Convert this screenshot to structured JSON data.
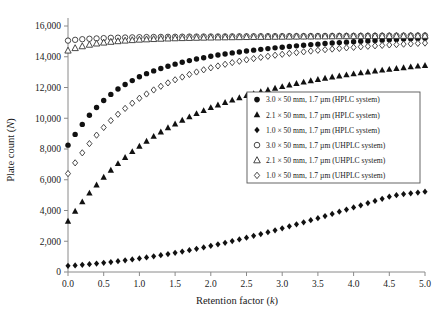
{
  "chart_data": {
    "type": "scatter",
    "title": "",
    "xlabel": "Retention factor (k)",
    "ylabel": "Plate count (N)",
    "xlim": [
      0.0,
      5.0
    ],
    "ylim": [
      0,
      16000
    ],
    "xticks": [
      "0.0",
      "0.5",
      "1.0",
      "1.5",
      "2.0",
      "2.5",
      "3.0",
      "3.5",
      "4.0",
      "4.5",
      "5.0"
    ],
    "xtick_values": [
      0.0,
      0.5,
      1.0,
      1.5,
      2.0,
      2.5,
      3.0,
      3.5,
      4.0,
      4.5,
      5.0
    ],
    "yticks": [
      "0",
      "2,000",
      "4,000",
      "6,000",
      "8,000",
      "10,000",
      "12,000",
      "14,000",
      "16,000"
    ],
    "ytick_values": [
      0,
      2000,
      4000,
      6000,
      8000,
      10000,
      12000,
      14000,
      16000
    ],
    "grid": false,
    "legend_position": "center-right",
    "x": [
      0.0,
      0.1,
      0.2,
      0.3,
      0.4,
      0.5,
      0.6,
      0.7,
      0.8,
      0.9,
      1.0,
      1.1,
      1.2,
      1.3,
      1.4,
      1.5,
      1.6,
      1.7,
      1.8,
      1.9,
      2.0,
      2.1,
      2.2,
      2.3,
      2.4,
      2.5,
      2.6,
      2.7,
      2.8,
      2.9,
      3.0,
      3.1,
      3.2,
      3.3,
      3.4,
      3.5,
      3.6,
      3.7,
      3.8,
      3.9,
      4.0,
      4.1,
      4.2,
      4.3,
      4.4,
      4.5,
      4.6,
      4.7,
      4.8,
      4.9,
      5.0
    ],
    "series": [
      {
        "name": "3.0 × 50 mm, 1.7 µm (HPLC system)",
        "marker": "circle-filled",
        "values": [
          8250,
          8950,
          9600,
          10200,
          10700,
          11150,
          11550,
          11900,
          12200,
          12450,
          12700,
          12900,
          13080,
          13240,
          13380,
          13520,
          13640,
          13750,
          13850,
          13940,
          14030,
          14110,
          14180,
          14250,
          14310,
          14370,
          14430,
          14480,
          14530,
          14580,
          14620,
          14670,
          14710,
          14750,
          14790,
          14820,
          14860,
          14890,
          14920,
          14950,
          14980,
          15010,
          15030,
          15060,
          15080,
          15100,
          15130,
          15150,
          15170,
          15190,
          15210
        ]
      },
      {
        "name": "2.1 × 50 mm, 1.7 µm (HPLC system)",
        "marker": "triangle-filled",
        "values": [
          3300,
          3950,
          4560,
          5130,
          5660,
          6160,
          6620,
          7050,
          7450,
          7830,
          8180,
          8510,
          8820,
          9110,
          9380,
          9630,
          9870,
          10090,
          10300,
          10500,
          10690,
          10860,
          11030,
          11180,
          11330,
          11470,
          11600,
          11720,
          11840,
          11950,
          12060,
          12160,
          12260,
          12350,
          12440,
          12520,
          12600,
          12680,
          12750,
          12820,
          12890,
          12950,
          13010,
          13070,
          13130,
          13180,
          13240,
          13290,
          13340,
          13390,
          13430
        ]
      },
      {
        "name": "1.0 × 50 mm, 1.7 µm (HPLC system)",
        "marker": "diamond-filled",
        "values": [
          400,
          430,
          470,
          510,
          550,
          600,
          650,
          700,
          760,
          820,
          880,
          950,
          1020,
          1090,
          1170,
          1250,
          1330,
          1420,
          1510,
          1600,
          1700,
          1800,
          1900,
          2010,
          2120,
          2230,
          2350,
          2470,
          2590,
          2710,
          2840,
          2970,
          3100,
          3230,
          3370,
          3500,
          3640,
          3780,
          3920,
          4060,
          4200,
          4340,
          4480,
          4620,
          4760,
          4900,
          5000,
          5070,
          5120,
          5170,
          5220
        ]
      },
      {
        "name": "3.0 × 50 mm, 1.7 µm (UHPLC system)",
        "marker": "circle-open",
        "values": [
          15050,
          15100,
          15140,
          15170,
          15190,
          15210,
          15230,
          15240,
          15250,
          15260,
          15270,
          15280,
          15285,
          15290,
          15295,
          15300,
          15305,
          15310,
          15312,
          15315,
          15318,
          15320,
          15322,
          15325,
          15328,
          15330,
          15332,
          15334,
          15336,
          15338,
          15340,
          15342,
          15344,
          15346,
          15348,
          15350,
          15352,
          15354,
          15356,
          15358,
          15360,
          15362,
          15364,
          15366,
          15368,
          15370,
          15372,
          15374,
          15376,
          15378,
          15380
        ]
      },
      {
        "name": "2.1 × 50 mm, 1.7 µm (UHPLC system)",
        "marker": "triangle-open",
        "values": [
          14400,
          14560,
          14680,
          14780,
          14860,
          14920,
          14970,
          15010,
          15050,
          15080,
          15110,
          15130,
          15150,
          15170,
          15185,
          15200,
          15212,
          15222,
          15232,
          15240,
          15248,
          15255,
          15262,
          15268,
          15274,
          15280,
          15285,
          15290,
          15294,
          15298,
          15302,
          15306,
          15310,
          15313,
          15316,
          15320,
          15323,
          15326,
          15329,
          15332,
          15335,
          15338,
          15340,
          15343,
          15346,
          15348,
          15351,
          15353,
          15356,
          15358,
          15360
        ]
      },
      {
        "name": "1.0 × 50 mm, 1.7 µm (UHPLC system)",
        "marker": "diamond-open",
        "values": [
          6400,
          7100,
          7750,
          8350,
          8900,
          9400,
          9850,
          10260,
          10640,
          10980,
          11300,
          11580,
          11840,
          12080,
          12300,
          12500,
          12680,
          12850,
          13010,
          13150,
          13280,
          13400,
          13510,
          13620,
          13710,
          13800,
          13880,
          13960,
          14030,
          14100,
          14160,
          14220,
          14270,
          14320,
          14370,
          14420,
          14460,
          14500,
          14540,
          14580,
          14610,
          14650,
          14680,
          14710,
          14740,
          14770,
          14790,
          14820,
          14840,
          14870,
          14890
        ]
      }
    ]
  },
  "legend": {
    "entries": [
      {
        "label": "3.0 × 50 mm, 1.7 µm (HPLC system)",
        "marker": "circle-filled"
      },
      {
        "label": "2.1 × 50 mm, 1.7 µm (HPLC system)",
        "marker": "triangle-filled"
      },
      {
        "label": "1.0 × 50 mm, 1.7 µm (HPLC system)",
        "marker": "diamond-filled"
      },
      {
        "label": "3.0 × 50 mm, 1.7 µm (UHPLC system)",
        "marker": "circle-open"
      },
      {
        "label": "2.1 × 50 mm, 1.7 µm (UHPLC system)",
        "marker": "triangle-open"
      },
      {
        "label": "1.0 × 50 mm, 1.7 µm (UHPLC system)",
        "marker": "diamond-open"
      }
    ]
  },
  "axis_titles": {
    "x_main": "Retention factor (",
    "x_italic": "k",
    "x_close": ")",
    "y_main": "Plate count (",
    "y_italic": "N",
    "y_close": ")"
  },
  "colors": {
    "marker_fill": "#111111",
    "marker_stroke": "#333333",
    "axis": "#8a8a8a",
    "legend_border": "#555555",
    "background": "#ffffff"
  }
}
